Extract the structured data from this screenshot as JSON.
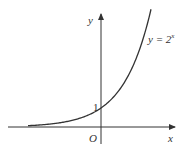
{
  "figure": {
    "type": "function-graph",
    "function_label": {
      "lhs": "y = 2",
      "exponent": "x"
    },
    "axes": {
      "x_label": "x",
      "y_label": "y",
      "origin_label": "O"
    },
    "y_intercept_label": "1",
    "colors": {
      "curve": "#333333",
      "axes": "#333333",
      "text": "#333333"
    }
  }
}
